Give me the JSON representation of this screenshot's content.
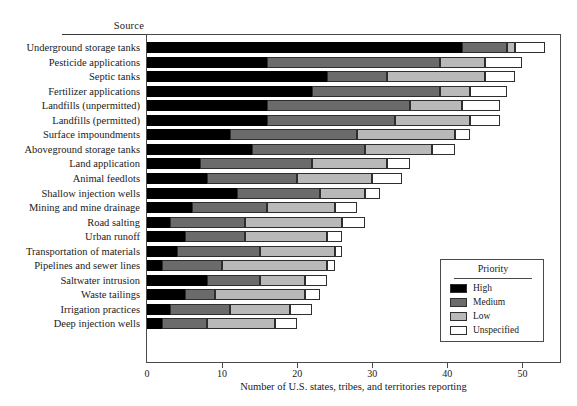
{
  "chart": {
    "source_column_header": "Source",
    "xaxis_title": "Number of U.S. states, tribes, and territories reporting",
    "legend_title": "Priority"
  },
  "chart_data": {
    "type": "bar",
    "orientation": "horizontal",
    "stacked": true,
    "title": "",
    "subtitle": "",
    "xlabel": "Number of U.S. states, tribes, and territories reporting",
    "ylabel": "Source",
    "xlim": [
      0,
      55
    ],
    "xticks": [
      0,
      10,
      20,
      30,
      40,
      50
    ],
    "xtick_labels": [
      "0",
      "10",
      "20",
      "30",
      "40",
      "50"
    ],
    "grid": false,
    "legend_title": "Priority",
    "legend_position": "inside-bottom-right",
    "categories": [
      "Underground storage tanks",
      "Pesticide applications",
      "Septic tanks",
      "Fertilizer applications",
      "Landfills (unpermitted)",
      "Landfills (permitted)",
      "Surface impoundments",
      "Aboveground storage tanks",
      "Land application",
      "Animal feedlots",
      "Shallow injection wells",
      "Mining and mine drainage",
      "Road salting",
      "Urban runoff",
      "Transportation of materials",
      "Pipelines and sewer lines",
      "Saltwater intrusion",
      "Waste tailings",
      "Irrigation practices",
      "Deep injection wells"
    ],
    "series": [
      {
        "name": "High",
        "color": "#000000",
        "values": [
          42,
          16,
          24,
          22,
          16,
          16,
          11,
          14,
          7,
          8,
          12,
          6,
          3,
          5,
          4,
          2,
          8,
          5,
          3,
          2
        ]
      },
      {
        "name": "Medium",
        "color": "#6b6b6b",
        "values": [
          6,
          23,
          8,
          17,
          19,
          17,
          17,
          15,
          15,
          12,
          11,
          10,
          10,
          8,
          11,
          8,
          7,
          4,
          8,
          6
        ]
      },
      {
        "name": "Low",
        "color": "#b9b9b9",
        "values": [
          1,
          6,
          13,
          4,
          7,
          10,
          13,
          9,
          10,
          10,
          6,
          9,
          13,
          11,
          10,
          14,
          6,
          12,
          8,
          9
        ]
      },
      {
        "name": "Unspecified",
        "color": "#ffffff",
        "values": [
          4,
          5,
          4,
          5,
          5,
          4,
          2,
          3,
          3,
          4,
          2,
          3,
          3,
          2,
          1,
          1,
          3,
          2,
          3,
          3
        ]
      }
    ],
    "totals": [
      53,
      50,
      49,
      48,
      47,
      47,
      43,
      41,
      35,
      34,
      31,
      28,
      29,
      26,
      26,
      25,
      24,
      23,
      22,
      20
    ]
  },
  "legend": {
    "items": [
      {
        "label": "High",
        "color": "#000000"
      },
      {
        "label": "Medium",
        "color": "#6b6b6b"
      },
      {
        "label": "Low",
        "color": "#b9b9b9"
      },
      {
        "label": "Unspecified",
        "color": "#ffffff"
      }
    ]
  }
}
